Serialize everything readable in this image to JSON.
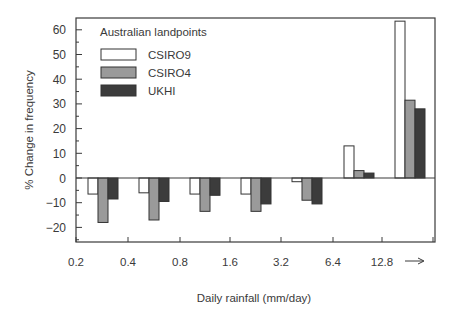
{
  "chart_data": {
    "type": "bar",
    "title": "",
    "legend_title": "Australian landpoints",
    "xlabel": "Daily rainfall (mm/day)",
    "ylabel": "% Change in frequency",
    "ylim": [
      -25,
      64
    ],
    "yticks": [
      60,
      50,
      40,
      30,
      20,
      10,
      0,
      -10,
      -20
    ],
    "xtick_labels": [
      "0.2",
      "0.4",
      "0.8",
      "1.6",
      "3.2",
      "6.4",
      "12.8",
      "→"
    ],
    "categories": [
      "0.2-0.4",
      "0.4-0.8",
      "0.8-1.6",
      "1.6-3.2",
      "3.2-6.4",
      "6.4-12.8",
      ">12.8"
    ],
    "series": [
      {
        "name": "CSIRO9",
        "color": "#ffffff",
        "values": [
          -6.5,
          -6,
          -6.5,
          -6.5,
          -1.5,
          13,
          63.5
        ]
      },
      {
        "name": "CSIRO4",
        "color": "#9a9a9a",
        "values": [
          -18,
          -17,
          -13.5,
          -13.5,
          -9,
          3,
          31.5
        ]
      },
      {
        "name": "UKHI",
        "color": "#3c3c3c",
        "values": [
          -8.5,
          -9.5,
          -7,
          -10.5,
          -10.5,
          2,
          28
        ]
      }
    ],
    "legend_position": "upper-left",
    "grid": false
  }
}
